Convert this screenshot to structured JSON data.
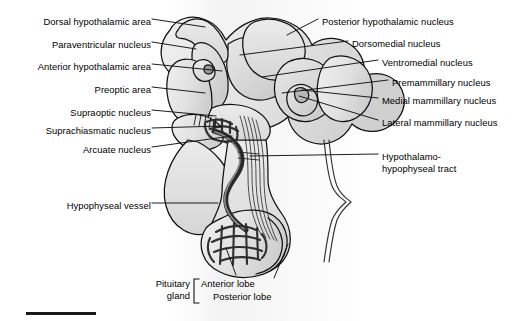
{
  "figure": {
    "background_color": "#ffffff",
    "line_color": "#000000",
    "fill_light": "#e8e8e8",
    "fill_mid": "#d2d2d2",
    "fill_dark": "#8a8a8a",
    "width": 524,
    "height": 321
  },
  "labels_left": [
    {
      "id": "dorsal-hypothalamic-area",
      "text": "Dorsal hypothalamic area",
      "x": 148,
      "y": 22,
      "leader_to_x": 205,
      "leader_to_y": 27
    },
    {
      "id": "paraventricular-nucleus",
      "text": "Paraventricular nucleus",
      "x": 148,
      "y": 45,
      "leader_to_x": 196,
      "leader_to_y": 49
    },
    {
      "id": "anterior-hypothalamic-area",
      "text": "Anterior hypothalamic area",
      "x": 148,
      "y": 67,
      "leader_to_x": 222,
      "leader_to_y": 71
    },
    {
      "id": "preoptic-area",
      "text": "Preoptic area",
      "x": 148,
      "y": 90,
      "leader_to_x": 205,
      "leader_to_y": 93
    },
    {
      "id": "supraoptic-nucleus",
      "text": "Supraoptic nucleus",
      "x": 148,
      "y": 113,
      "leader_to_x": 216,
      "leader_to_y": 116
    },
    {
      "id": "suprachiasmatic-nucleus",
      "text": "Suprachiasmatic nucleus",
      "x": 148,
      "y": 131,
      "leader_to_x": 222,
      "leader_to_y": 126
    },
    {
      "id": "arcuate-nucleus",
      "text": "Arcuate nucleus",
      "x": 148,
      "y": 150,
      "leader_to_x": 229,
      "leader_to_y": 139
    },
    {
      "id": "hypophyseal-vessel",
      "text": "Hypophyseal vessel",
      "x": 148,
      "y": 206,
      "leader_to_x": 216,
      "leader_to_y": 206
    }
  ],
  "labels_right": [
    {
      "id": "posterior-hypothalamic-nucleus",
      "text": "Posterior hypothalamic nucleus",
      "x": 322,
      "y": 22,
      "leader_to_x": 292,
      "leader_to_y": 32
    },
    {
      "id": "dorsomedial-nucleus",
      "text": "Dorsomedial nucleus",
      "x": 352,
      "y": 44,
      "leader_to_x": 240,
      "leader_to_y": 55
    },
    {
      "id": "ventromedial-nucleus",
      "text": "Ventromedial nucleus",
      "x": 382,
      "y": 63,
      "leader_to_x": 260,
      "leader_to_y": 77
    },
    {
      "id": "premammillary-nucleus",
      "text": "Premammillary nucleus",
      "x": 392,
      "y": 83,
      "leader_to_x": 282,
      "leader_to_y": 93
    },
    {
      "id": "medial-mammillary-nucleus",
      "text": "Medial mammillary nucleus",
      "x": 382,
      "y": 101,
      "leader_to_x": 300,
      "leader_to_y": 91
    },
    {
      "id": "lateral-mammillary-nucleus",
      "text": "Lateral mammillary nucleus",
      "x": 382,
      "y": 123,
      "leader_to_x": 298,
      "leader_to_y": 96
    },
    {
      "id": "hypothalamo-hypophyseal-tract-line1",
      "text": "Hypothalamo-",
      "x": 382,
      "y": 157,
      "leader_to_x": 236,
      "leader_to_y": 160
    },
    {
      "id": "hypothalamo-hypophyseal-tract-line2",
      "text": "hypophyseal tract",
      "x": 382,
      "y": 169
    }
  ],
  "pituitary_bracket": {
    "gland_line1": "Pituitary",
    "gland_line2": "gland",
    "anterior_lobe": "Anterior lobe",
    "posterior_lobe": "Posterior lobe",
    "anterior_leader_to_x": 232,
    "anterior_leader_to_y": 250,
    "posterior_leader_to_x": 272,
    "posterior_leader_to_y": 248
  },
  "scale_bar": {
    "x": 26,
    "y": 313,
    "width": 70,
    "thickness": 3,
    "color": "#1a1a1a"
  }
}
